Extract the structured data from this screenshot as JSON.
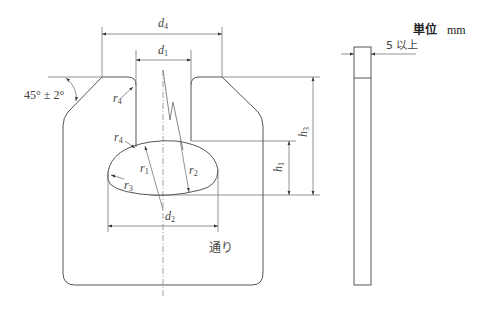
{
  "header": {
    "unit_label": "単位",
    "unit_value": "mm"
  },
  "labels": {
    "d4": {
      "sym": "d",
      "sub": "4"
    },
    "d1": {
      "sym": "d",
      "sub": "1"
    },
    "d2": {
      "sym": "d",
      "sub": "2"
    },
    "h1": {
      "sym": "h",
      "sub": "1"
    },
    "h3": {
      "sym": "h",
      "sub": "3"
    },
    "r1": {
      "sym": "r",
      "sub": "1"
    },
    "r2": {
      "sym": "r",
      "sub": "2"
    },
    "r3": {
      "sym": "r",
      "sub": "3"
    },
    "r4_top": {
      "sym": "r",
      "sub": "4"
    },
    "r4_mid": {
      "sym": "r",
      "sub": "4"
    },
    "angle": "45° ± 2°",
    "thickness": "5 以上",
    "pass_side": "通り"
  },
  "colors": {
    "line": "#555555",
    "dim_line": "#666666",
    "center_line": "#888888"
  }
}
